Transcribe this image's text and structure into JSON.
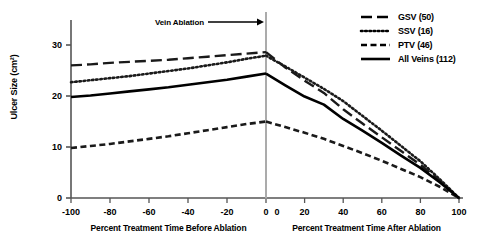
{
  "chart_data": {
    "type": "line",
    "title": "",
    "ylabel": "Ulcer Size (cm²)",
    "ylim": [
      0,
      32
    ],
    "yticks": [
      0,
      10,
      20,
      30
    ],
    "ytick_labels": [
      "0",
      "10",
      "20",
      "30"
    ],
    "grid": false,
    "legend_position": "top-right",
    "panels": [
      {
        "name": "before-ablation",
        "xlabel": "Percent Treatment Time Before Ablation",
        "xlim": [
          -100,
          0
        ],
        "xticks": [
          -100,
          -80,
          -60,
          -40,
          -20,
          0
        ],
        "xtick_labels": [
          "-100",
          "-80",
          "-60",
          "-40",
          "-20",
          "0"
        ]
      },
      {
        "name": "after-ablation",
        "xlabel": "Percent Treatment Time After Ablation",
        "xlim": [
          0,
          100
        ],
        "xticks": [
          0,
          20,
          40,
          60,
          80,
          100
        ],
        "xtick_labels": [
          "0",
          "20",
          "40",
          "60",
          "80",
          "100"
        ]
      }
    ],
    "annotations": [
      {
        "name": "vein-ablation-marker",
        "text": "Vein Ablation",
        "arrow": "right",
        "x": 0,
        "kind": "vertical-divider"
      }
    ],
    "series": [
      {
        "name": "GSV (50)",
        "short": "GSV",
        "n": 50,
        "style": "long-dash",
        "color": "#1a1a1a",
        "points_before": [
          {
            "x": -100,
            "y": 26.0
          },
          {
            "x": -90,
            "y": 26.2
          },
          {
            "x": -80,
            "y": 26.5
          },
          {
            "x": -70,
            "y": 26.7
          },
          {
            "x": -60,
            "y": 26.9
          },
          {
            "x": -50,
            "y": 27.1
          },
          {
            "x": -40,
            "y": 27.4
          },
          {
            "x": -30,
            "y": 27.7
          },
          {
            "x": -20,
            "y": 28.0
          },
          {
            "x": -10,
            "y": 28.3
          },
          {
            "x": 0,
            "y": 28.6
          }
        ],
        "points_after": [
          {
            "x": 0,
            "y": 28.6
          },
          {
            "x": 10,
            "y": 25.6
          },
          {
            "x": 20,
            "y": 23.0
          },
          {
            "x": 30,
            "y": 20.6
          },
          {
            "x": 40,
            "y": 17.4
          },
          {
            "x": 50,
            "y": 14.6
          },
          {
            "x": 60,
            "y": 11.9
          },
          {
            "x": 70,
            "y": 9.2
          },
          {
            "x": 80,
            "y": 6.5
          },
          {
            "x": 90,
            "y": 3.4
          },
          {
            "x": 100,
            "y": 0.0
          }
        ]
      },
      {
        "name": "SSV (16)",
        "short": "SSV",
        "n": 16,
        "style": "dotted",
        "color": "#1a1a1a",
        "points_before": [
          {
            "x": -100,
            "y": 22.7
          },
          {
            "x": -90,
            "y": 23.1
          },
          {
            "x": -80,
            "y": 23.5
          },
          {
            "x": -70,
            "y": 23.9
          },
          {
            "x": -60,
            "y": 24.4
          },
          {
            "x": -50,
            "y": 24.9
          },
          {
            "x": -40,
            "y": 25.4
          },
          {
            "x": -30,
            "y": 26.0
          },
          {
            "x": -20,
            "y": 26.6
          },
          {
            "x": -10,
            "y": 27.3
          },
          {
            "x": 0,
            "y": 27.9
          }
        ],
        "points_after": [
          {
            "x": 0,
            "y": 27.9
          },
          {
            "x": 10,
            "y": 25.8
          },
          {
            "x": 20,
            "y": 23.6
          },
          {
            "x": 30,
            "y": 21.4
          },
          {
            "x": 40,
            "y": 19.0
          },
          {
            "x": 50,
            "y": 16.1
          },
          {
            "x": 60,
            "y": 13.2
          },
          {
            "x": 70,
            "y": 10.2
          },
          {
            "x": 80,
            "y": 7.2
          },
          {
            "x": 90,
            "y": 3.7
          },
          {
            "x": 100,
            "y": 0.0
          }
        ]
      },
      {
        "name": "PTV (46)",
        "short": "PTV",
        "n": 46,
        "style": "short-dash",
        "color": "#1a1a1a",
        "points_before": [
          {
            "x": -100,
            "y": 9.8
          },
          {
            "x": -90,
            "y": 10.2
          },
          {
            "x": -80,
            "y": 10.6
          },
          {
            "x": -70,
            "y": 11.1
          },
          {
            "x": -60,
            "y": 11.6
          },
          {
            "x": -50,
            "y": 12.1
          },
          {
            "x": -40,
            "y": 12.7
          },
          {
            "x": -30,
            "y": 13.3
          },
          {
            "x": -20,
            "y": 13.9
          },
          {
            "x": -10,
            "y": 14.5
          },
          {
            "x": 0,
            "y": 15.0
          }
        ],
        "points_after": [
          {
            "x": 0,
            "y": 15.0
          },
          {
            "x": 10,
            "y": 13.9
          },
          {
            "x": 20,
            "y": 12.8
          },
          {
            "x": 30,
            "y": 11.6
          },
          {
            "x": 40,
            "y": 10.2
          },
          {
            "x": 50,
            "y": 8.8
          },
          {
            "x": 60,
            "y": 7.3
          },
          {
            "x": 70,
            "y": 5.7
          },
          {
            "x": 80,
            "y": 4.1
          },
          {
            "x": 90,
            "y": 2.2
          },
          {
            "x": 100,
            "y": 0.0
          }
        ]
      },
      {
        "name": "All Veins (112)",
        "short": "All Veins",
        "n": 112,
        "style": "solid",
        "color": "#000000",
        "points_before": [
          {
            "x": -100,
            "y": 19.8
          },
          {
            "x": -90,
            "y": 20.1
          },
          {
            "x": -80,
            "y": 20.5
          },
          {
            "x": -70,
            "y": 20.9
          },
          {
            "x": -60,
            "y": 21.3
          },
          {
            "x": -50,
            "y": 21.7
          },
          {
            "x": -40,
            "y": 22.2
          },
          {
            "x": -30,
            "y": 22.7
          },
          {
            "x": -20,
            "y": 23.2
          },
          {
            "x": -10,
            "y": 23.8
          },
          {
            "x": 0,
            "y": 24.4
          }
        ],
        "points_after": [
          {
            "x": 0,
            "y": 24.4
          },
          {
            "x": 10,
            "y": 22.1
          },
          {
            "x": 20,
            "y": 19.9
          },
          {
            "x": 30,
            "y": 18.3
          },
          {
            "x": 40,
            "y": 15.5
          },
          {
            "x": 50,
            "y": 13.2
          },
          {
            "x": 60,
            "y": 10.8
          },
          {
            "x": 70,
            "y": 8.3
          },
          {
            "x": 80,
            "y": 5.9
          },
          {
            "x": 90,
            "y": 3.1
          },
          {
            "x": 100,
            "y": 0.0
          }
        ]
      }
    ]
  },
  "legend": {
    "items": [
      {
        "label": "GSV (50)",
        "style": "long-dash"
      },
      {
        "label": "SSV (16)",
        "style": "dotted"
      },
      {
        "label": "PTV (46)",
        "style": "short-dash"
      },
      {
        "label": "All Veins (112)",
        "style": "solid"
      }
    ]
  }
}
